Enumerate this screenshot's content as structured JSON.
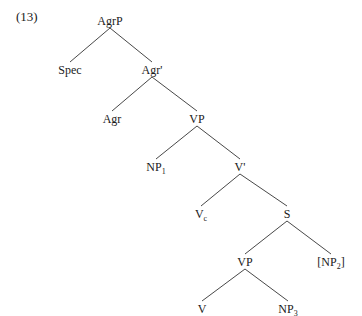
{
  "example_number": "(13)",
  "tree": {
    "nodes": [
      {
        "id": "AgrP",
        "label": "AgrP",
        "sub": "",
        "x": 110,
        "y": 14
      },
      {
        "id": "Spec",
        "label": "Spec",
        "sub": "",
        "x": 70,
        "y": 63
      },
      {
        "id": "AgrBar",
        "label": "Agr'",
        "sub": "",
        "x": 152,
        "y": 63
      },
      {
        "id": "Agr",
        "label": "Agr",
        "sub": "",
        "x": 112,
        "y": 112
      },
      {
        "id": "VP1",
        "label": "VP",
        "sub": "",
        "x": 197,
        "y": 112
      },
      {
        "id": "NP1",
        "label": "NP",
        "sub": "1",
        "x": 156,
        "y": 160
      },
      {
        "id": "VBar",
        "label": "V'",
        "sub": "",
        "x": 240,
        "y": 160
      },
      {
        "id": "Vc",
        "label": "V",
        "sub": "c",
        "x": 201,
        "y": 207
      },
      {
        "id": "S",
        "label": "S",
        "sub": "",
        "x": 287,
        "y": 207
      },
      {
        "id": "VP2",
        "label": "VP",
        "sub": "",
        "x": 245,
        "y": 255
      },
      {
        "id": "NP2",
        "label": "[NP",
        "sub": "2",
        "tail": "]",
        "x": 331,
        "y": 255
      },
      {
        "id": "V",
        "label": "V",
        "sub": "",
        "x": 202,
        "y": 302
      },
      {
        "id": "NP3",
        "label": "NP",
        "sub": "3",
        "x": 288,
        "y": 302
      }
    ],
    "edges": [
      [
        "AgrP",
        "Spec"
      ],
      [
        "AgrP",
        "AgrBar"
      ],
      [
        "AgrBar",
        "Agr"
      ],
      [
        "AgrBar",
        "VP1"
      ],
      [
        "VP1",
        "NP1"
      ],
      [
        "VP1",
        "VBar"
      ],
      [
        "VBar",
        "Vc"
      ],
      [
        "VBar",
        "S"
      ],
      [
        "S",
        "VP2"
      ],
      [
        "S",
        "NP2"
      ],
      [
        "VP2",
        "V"
      ],
      [
        "VP2",
        "NP3"
      ]
    ]
  }
}
